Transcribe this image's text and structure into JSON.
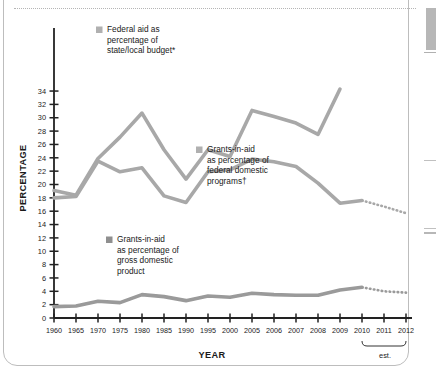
{
  "chart_data": {
    "type": "line",
    "title": "",
    "xlabel": "YEAR",
    "ylabel": "PERCENTAGE",
    "ylim": [
      0,
      35
    ],
    "ytick_step": 2,
    "yticks": [
      0,
      2,
      4,
      6,
      8,
      10,
      12,
      14,
      16,
      18,
      20,
      22,
      24,
      26,
      28,
      30,
      32,
      34
    ],
    "categories": [
      "1960",
      "1965",
      "1970",
      "1975",
      "1980",
      "1985",
      "1990",
      "1995",
      "2000",
      "2005",
      "2006",
      "2007",
      "2008",
      "2009",
      "2010",
      "2011",
      "2012"
    ],
    "grid": false,
    "legend_position": "inside",
    "annotation": "est.",
    "annotation_range": [
      "2010",
      "2012"
    ],
    "series": [
      {
        "name": "Federal aid as percentage of state/local budget*",
        "color": "#a8a8a8",
        "values": [
          19.1,
          18.4,
          23.9,
          27.1,
          30.7,
          25.2,
          20.8,
          25.2,
          24.2,
          31.1,
          30.2,
          29.2,
          27.5,
          34.3,
          null,
          null,
          null
        ],
        "dotted_from": null
      },
      {
        "name": "Grants-in-aid as percentage of federal domestic programs†",
        "color": "#a8a8a8",
        "values": [
          18.0,
          18.2,
          23.5,
          21.9,
          22.5,
          18.3,
          17.3,
          21.9,
          22.2,
          23.8,
          23.4,
          22.7,
          20.2,
          17.2,
          17.6,
          16.7,
          15.7
        ],
        "dotted_from": "2010"
      },
      {
        "name": "Grants-in-aid as percentage of gross domestic product",
        "color": "#9a9a9a",
        "values": [
          1.7,
          1.8,
          2.5,
          2.3,
          3.5,
          3.2,
          2.6,
          3.3,
          3.1,
          3.7,
          3.5,
          3.4,
          3.4,
          4.2,
          4.6,
          4.0,
          3.8
        ],
        "dotted_from": "2010"
      }
    ]
  },
  "axes": {
    "y_title": "PERCENTAGE",
    "x_title": "YEAR"
  },
  "legend": [
    {
      "swatch_color": "#b0b0b0",
      "lines": [
        "Federal aid as",
        "percentage of",
        "state/local budget*"
      ]
    },
    {
      "swatch_color": "#b0b0b0",
      "lines": [
        "Grants-in-aid",
        "as percentage of",
        "federal domestic",
        "programs†"
      ]
    },
    {
      "swatch_color": "#8f8f8f",
      "lines": [
        "Grants-in-aid",
        "as percentage of",
        "gross domestic",
        "product"
      ]
    }
  ],
  "estimate_note": "est.",
  "colors": {
    "line_light": "#a8a8a8",
    "line_dark": "#9a9a9a",
    "axis": "#222222",
    "text": "#1a1a1a",
    "frame": "#bdbdbd"
  }
}
